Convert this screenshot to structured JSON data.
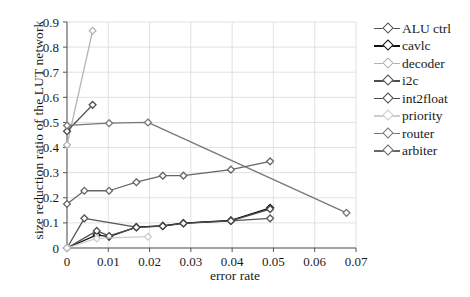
{
  "chart_data": {
    "type": "line",
    "title": "",
    "xlabel": "error rate",
    "ylabel": "size reduction ratio of the LUT network",
    "xlim": [
      0,
      0.07
    ],
    "ylim": [
      0,
      0.9
    ],
    "xticks": [
      "0",
      "0.01",
      "0.02",
      "0.03",
      "0.04",
      "0.05",
      "0.06",
      "0.07"
    ],
    "xtick_values": [
      0,
      0.01,
      0.02,
      0.03,
      0.04,
      0.05,
      0.06,
      0.07
    ],
    "yticks": [
      "0",
      "0.1",
      "0.2",
      "0.3",
      "0.4",
      "0.5",
      "0.6",
      "0.7",
      "0.8",
      "0.9"
    ],
    "ytick_values": [
      0,
      0.1,
      0.2,
      0.3,
      0.4,
      0.5,
      0.6,
      0.7,
      0.8,
      0.9
    ],
    "grid": true,
    "legend_position": "right",
    "marker": "diamond",
    "series": [
      {
        "name": "ALU ctrl",
        "color": "#555555",
        "x": [
          0,
          0.0042,
          0.0168,
          0.0232,
          0.0282,
          0.0397,
          0.0492
        ],
        "y": [
          0.0,
          0.118,
          0.083,
          0.088,
          0.099,
          0.108,
          0.118
        ]
      },
      {
        "name": "cavlc",
        "color": "#111111",
        "x": [
          0,
          0.0072,
          0.0102,
          0.0168,
          0.0232,
          0.0282,
          0.0397,
          0.0492
        ],
        "y": [
          0.0,
          0.052,
          0.045,
          0.083,
          0.088,
          0.099,
          0.11,
          0.16
        ]
      },
      {
        "name": "decoder",
        "color": "#b3b3b3",
        "x": [
          0,
          0.0062
        ],
        "y": [
          0.41,
          0.865
        ]
      },
      {
        "name": "i2c",
        "color": "#4d4d4d",
        "x": [
          0,
          0.0072,
          0.0102,
          0.0168,
          0.0232,
          0.0282,
          0.0397,
          0.0492
        ],
        "y": [
          0.0,
          0.068,
          0.048,
          0.082,
          0.087,
          0.098,
          0.108,
          0.155
        ]
      },
      {
        "name": "int2float",
        "color": "#4a4a4a",
        "x": [
          0,
          0.0062
        ],
        "y": [
          0.465,
          0.57
        ]
      },
      {
        "name": "priority",
        "color": "#cccccc",
        "x": [
          0,
          0.0072,
          0.0196
        ],
        "y": [
          0.0,
          0.038,
          0.045
        ]
      },
      {
        "name": "router",
        "color": "#777777",
        "x": [
          0,
          0.0102,
          0.0196,
          0.0677
        ],
        "y": [
          0.488,
          0.497,
          0.5,
          0.14
        ]
      },
      {
        "name": "arbiter",
        "color": "#666666",
        "x": [
          0,
          0.0042,
          0.0102,
          0.0168,
          0.0232,
          0.0282,
          0.0397,
          0.0492
        ],
        "y": [
          0.175,
          0.228,
          0.228,
          0.262,
          0.288,
          0.288,
          0.312,
          0.345
        ]
      }
    ]
  },
  "legend": {
    "items": [
      {
        "label": "ALU ctrl",
        "color": "#555555"
      },
      {
        "label": "cavlc",
        "color": "#111111"
      },
      {
        "label": "decoder",
        "color": "#b3b3b3"
      },
      {
        "label": "i2c",
        "color": "#4d4d4d"
      },
      {
        "label": "int2float",
        "color": "#4a4a4a"
      },
      {
        "label": "priority",
        "color": "#cccccc"
      },
      {
        "label": "router",
        "color": "#777777"
      },
      {
        "label": "arbiter",
        "color": "#666666"
      }
    ]
  }
}
